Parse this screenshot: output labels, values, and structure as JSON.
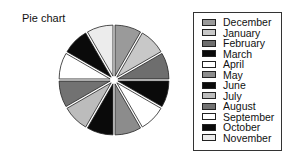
{
  "chart_data": {
    "type": "pie",
    "title": "Pie chart",
    "categories": [
      "December",
      "January",
      "February",
      "March",
      "April",
      "May",
      "June",
      "July",
      "August",
      "September",
      "October",
      "November"
    ],
    "values": [
      1,
      1,
      1,
      1,
      1,
      1,
      1,
      1,
      1,
      1,
      1,
      1
    ],
    "colors": [
      "#9a9a9a",
      "#c8c8c8",
      "#6e6e6e",
      "#0a0a0a",
      "#ffffff",
      "#8c8c8c",
      "#0a0a0a",
      "#bcbcbc",
      "#727272",
      "#ffffff",
      "#0a0a0a",
      "#ececec"
    ],
    "start_angle_deg": 0,
    "direction": "clockwise",
    "exploded": true,
    "legend_position": "right"
  },
  "title": "Pie chart",
  "legend": {
    "items": [
      {
        "label": "December",
        "color": "#9a9a9a"
      },
      {
        "label": "January",
        "color": "#c8c8c8"
      },
      {
        "label": "February",
        "color": "#6e6e6e"
      },
      {
        "label": "March",
        "color": "#0a0a0a"
      },
      {
        "label": "April",
        "color": "#ffffff"
      },
      {
        "label": "May",
        "color": "#8c8c8c"
      },
      {
        "label": "June",
        "color": "#0a0a0a"
      },
      {
        "label": "July",
        "color": "#bcbcbc"
      },
      {
        "label": "August",
        "color": "#727272"
      },
      {
        "label": "September",
        "color": "#ffffff"
      },
      {
        "label": "October",
        "color": "#0a0a0a"
      },
      {
        "label": "November",
        "color": "#ececec"
      }
    ]
  }
}
